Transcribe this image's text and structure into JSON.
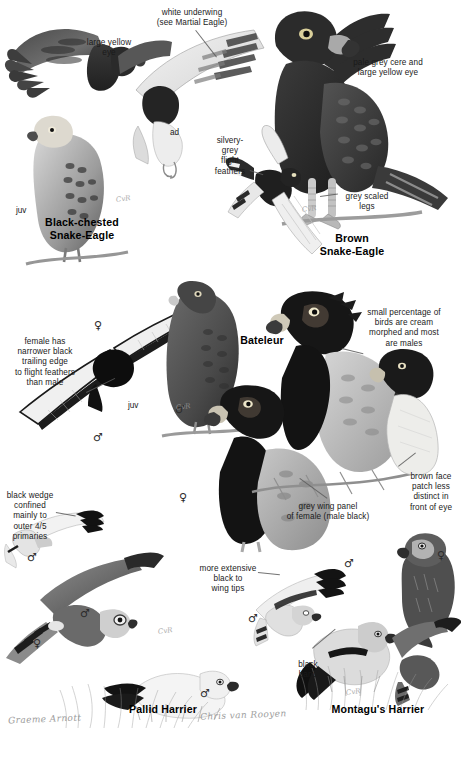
{
  "plate": {
    "width": 461,
    "height": 758,
    "background": "#ffffff",
    "ink": "#1a1a1a"
  },
  "species": [
    {
      "name": "Black-chested\nSnake-Eagle",
      "x": 82,
      "y": 216
    },
    {
      "name": "Brown\nSnake-Eagle",
      "x": 352,
      "y": 232
    },
    {
      "name": "Bateleur",
      "x": 262,
      "y": 334
    },
    {
      "name": "Pallid Harrier",
      "x": 163,
      "y": 703
    },
    {
      "name": "Montagu's Harrier",
      "x": 378,
      "y": 703
    }
  ],
  "callouts": [
    {
      "id": "white-underwing",
      "text": "white underwing\n(see Martial Eagle)",
      "x": 146,
      "y": 8,
      "w": 92,
      "align": "c"
    },
    {
      "id": "large-yellow-eye",
      "text": "large yellow\neye",
      "x": 78,
      "y": 38,
      "w": 62,
      "align": "c"
    },
    {
      "id": "pale-grey-cere",
      "text": "pale grey cere and\nlarge yellow eye",
      "x": 338,
      "y": 58,
      "w": 100,
      "align": "c"
    },
    {
      "id": "silvery-grey-flight-feathers",
      "text": "silvery-\ngrey\nflight\nfeathers",
      "x": 208,
      "y": 136,
      "w": 44,
      "align": "c"
    },
    {
      "id": "grey-scaled-legs",
      "text": "grey scaled\nlegs",
      "x": 336,
      "y": 192,
      "w": 62,
      "align": "c"
    },
    {
      "id": "female-narrower-black",
      "text": "female has\nnarrower black\ntrailing edge\nto flight feathers\nthan male",
      "x": 4,
      "y": 337,
      "w": 82,
      "align": "c"
    },
    {
      "id": "cream-morphed",
      "text": "small percentage of\nbirds are cream\nmorphed and most\nare males",
      "x": 352,
      "y": 308,
      "w": 104,
      "align": "c"
    },
    {
      "id": "grey-wing-panel",
      "text": "grey wing panel\nof female (male black)",
      "x": 272,
      "y": 502,
      "w": 112,
      "align": "c"
    },
    {
      "id": "brown-face-patch",
      "text": "brown face\npatch less\ndistinct in\nfront of eye",
      "x": 404,
      "y": 472,
      "w": 54,
      "align": "c"
    },
    {
      "id": "black-wedge",
      "text": "black wedge\nconfined\nmainly to\nouter 4/5\nprimaries",
      "x": 4,
      "y": 491,
      "w": 52,
      "align": "c"
    },
    {
      "id": "more-extensive-black",
      "text": "more extensive\nblack to\nwing tips",
      "x": 192,
      "y": 564,
      "w": 72,
      "align": "c"
    },
    {
      "id": "black-band",
      "text": "black\nband",
      "x": 292,
      "y": 660,
      "w": 32,
      "align": "c"
    }
  ],
  "age_labels": [
    {
      "text": "ad",
      "x": 170,
      "y": 128
    },
    {
      "text": "juv",
      "x": 16,
      "y": 206
    },
    {
      "text": "juv",
      "x": 128,
      "y": 401
    }
  ],
  "sex_labels": [
    {
      "symbol": "♀",
      "x": 94,
      "y": 320
    },
    {
      "symbol": "♂",
      "x": 93,
      "y": 432
    },
    {
      "symbol": "♂",
      "x": 175,
      "y": 404
    },
    {
      "symbol": "♀",
      "x": 179,
      "y": 492
    },
    {
      "symbol": "♂",
      "x": 27,
      "y": 552
    },
    {
      "symbol": "♀",
      "x": 33,
      "y": 638
    },
    {
      "symbol": "♂",
      "x": 248,
      "y": 613
    },
    {
      "symbol": "♂",
      "x": 200,
      "y": 688
    },
    {
      "symbol": "♂",
      "x": 344,
      "y": 558
    },
    {
      "symbol": "♀",
      "x": 437,
      "y": 550
    },
    {
      "symbol": "♂",
      "x": 80,
      "y": 608
    }
  ],
  "signatures": [
    {
      "id": "artist-signature-left",
      "text": "Graeme Arnott",
      "x": 8,
      "y": 714
    },
    {
      "id": "artist-signature-right",
      "text": "Chris van Rooyen",
      "x": 200,
      "y": 710
    }
  ],
  "artist_marks": [
    {
      "x": 116,
      "y": 195
    },
    {
      "x": 302,
      "y": 205
    },
    {
      "x": 176,
      "y": 403
    },
    {
      "x": 158,
      "y": 627
    },
    {
      "x": 346,
      "y": 688
    }
  ],
  "icons": {
    "female": "female-symbol-icon",
    "male": "male-symbol-icon"
  },
  "colors": {
    "ink": "#1a1a1a",
    "leader": "#5a5a5a",
    "dark_plumage": "#2f2f2f",
    "mid_plumage": "#6f6f6f",
    "light_plumage": "#c9c9c9",
    "pale": "#ececec",
    "grass": "#8a8a8a"
  }
}
